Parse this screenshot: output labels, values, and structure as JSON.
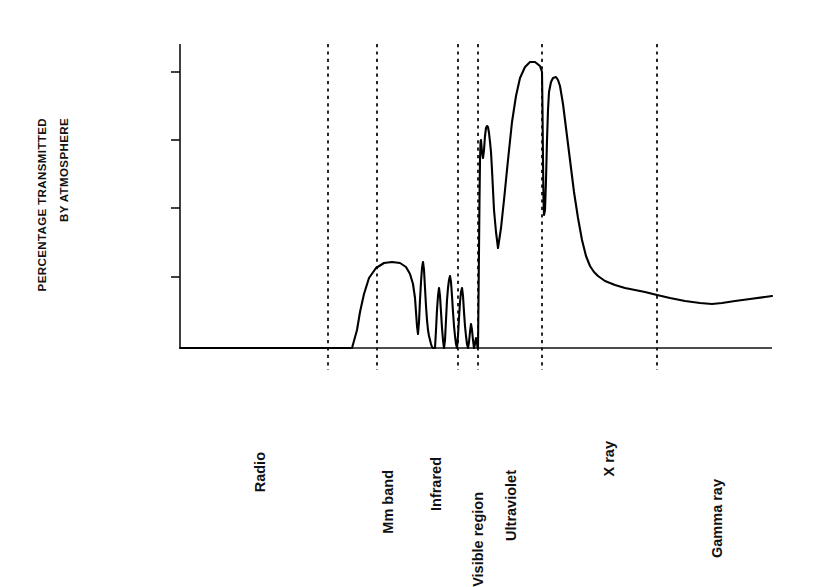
{
  "chart_data": {
    "type": "line",
    "title": "",
    "subtitle": "",
    "xlabel": "",
    "ylabel": "PERCENTAGE TRANSMITTED BY ATMOSPHERE",
    "ylabel_lines": [
      "PERCENTAGE TRANSMITTED",
      "BY ATMOSPHERE"
    ],
    "grid": false,
    "legend": "none",
    "y_scale": "log-inverted",
    "y_tick_labels": [
      "1%",
      ".01%",
      ".0001%",
      ".000001%"
    ],
    "y_ticks": [
      {
        "label": ".000001%",
        "y_px": 72
      },
      {
        "label": ".0001%",
        "y_px": 140
      },
      {
        "label": ".01%",
        "y_px": 208
      },
      {
        "label": "1%",
        "y_px": 277
      }
    ],
    "axis": {
      "x_left_px": 180,
      "x_right_px": 772,
      "y_top_px": 44,
      "y_baseline_px": 348
    },
    "band_labels": [
      "Radio",
      "Mm band",
      "Infrared",
      "Visible region",
      "Ultraviolet",
      "X ray",
      "Gamma ray"
    ],
    "bands": [
      {
        "name": "Radio",
        "label_x_px": 252,
        "label_y_px": 452
      },
      {
        "name": "Mm band",
        "label_x_px": 380,
        "label_y_px": 470
      },
      {
        "name": "Infrared",
        "label_x_px": 428,
        "label_y_px": 457
      },
      {
        "name": "Visible region",
        "label_x_px": 470,
        "label_y_px": 492
      },
      {
        "name": "Ultraviolet",
        "label_x_px": 503,
        "label_y_px": 470
      },
      {
        "name": "X ray",
        "label_x_px": 601,
        "label_y_px": 441
      },
      {
        "name": "Gamma ray",
        "label_x_px": 709,
        "label_y_px": 479
      }
    ],
    "divider_x_px": [
      328,
      377,
      458,
      478,
      542,
      657
    ],
    "divider_style": "dashed",
    "series": [
      {
        "name": "Atmospheric transmission",
        "color": "#000000",
        "points_px": [
          [
            180,
            348
          ],
          [
            315,
            348
          ],
          [
            352,
            348
          ],
          [
            357,
            330
          ],
          [
            360,
            312
          ],
          [
            364,
            294
          ],
          [
            369,
            278
          ],
          [
            376,
            268
          ],
          [
            384,
            263
          ],
          [
            392,
            262
          ],
          [
            400,
            263
          ],
          [
            406,
            267
          ],
          [
            410,
            274
          ],
          [
            413,
            284
          ],
          [
            415,
            298
          ],
          [
            416,
            312
          ],
          [
            417,
            326
          ],
          [
            418,
            334
          ],
          [
            419,
            322
          ],
          [
            420,
            300
          ],
          [
            421,
            282
          ],
          [
            422,
            268
          ],
          [
            423,
            262
          ],
          [
            424,
            270
          ],
          [
            425,
            288
          ],
          [
            426,
            306
          ],
          [
            427,
            320
          ],
          [
            428,
            330
          ],
          [
            429,
            336
          ],
          [
            430,
            340
          ],
          [
            431,
            344
          ],
          [
            432,
            347
          ],
          [
            433,
            348
          ],
          [
            435,
            348
          ],
          [
            436,
            330
          ],
          [
            437,
            310
          ],
          [
            438,
            296
          ],
          [
            439,
            288
          ],
          [
            440,
            296
          ],
          [
            441,
            312
          ],
          [
            442,
            328
          ],
          [
            443,
            340
          ],
          [
            444,
            348
          ],
          [
            445,
            340
          ],
          [
            446,
            320
          ],
          [
            447,
            300
          ],
          [
            448,
            288
          ],
          [
            449,
            280
          ],
          [
            450,
            276
          ],
          [
            451,
            282
          ],
          [
            452,
            296
          ],
          [
            453,
            312
          ],
          [
            454,
            326
          ],
          [
            455,
            336
          ],
          [
            456,
            344
          ],
          [
            457,
            348
          ],
          [
            458,
            336
          ],
          [
            459,
            318
          ],
          [
            460,
            302
          ],
          [
            461,
            292
          ],
          [
            462,
            288
          ],
          [
            463,
            296
          ],
          [
            464,
            312
          ],
          [
            465,
            326
          ],
          [
            466,
            336
          ],
          [
            467,
            344
          ],
          [
            468,
            348
          ],
          [
            469,
            342
          ],
          [
            470,
            332
          ],
          [
            471,
            324
          ],
          [
            472,
            330
          ],
          [
            473,
            340
          ],
          [
            474,
            348
          ],
          [
            475,
            344
          ],
          [
            476,
            338
          ],
          [
            477,
            342
          ],
          [
            477.5,
            348
          ],
          [
            478,
            348
          ],
          [
            478.5,
            300
          ],
          [
            479,
            250
          ],
          [
            479.5,
            200
          ],
          [
            480,
            160
          ],
          [
            480.5,
            142
          ],
          [
            481,
            140
          ],
          [
            482,
            152
          ],
          [
            483,
            158
          ],
          [
            484,
            150
          ],
          [
            485,
            136
          ],
          [
            486,
            128
          ],
          [
            487,
            126
          ],
          [
            488,
            127
          ],
          [
            489,
            133
          ],
          [
            490,
            142
          ],
          [
            491,
            152
          ],
          [
            492,
            170
          ],
          [
            493,
            190
          ],
          [
            494,
            210
          ],
          [
            496,
            232
          ],
          [
            498,
            248
          ],
          [
            501,
            228
          ],
          [
            504,
            200
          ],
          [
            508,
            160
          ],
          [
            512,
            122
          ],
          [
            516,
            96
          ],
          [
            520,
            78
          ],
          [
            525,
            67
          ],
          [
            530,
            62
          ],
          [
            535,
            62
          ],
          [
            540,
            66
          ],
          [
            542,
            72
          ],
          [
            542.5,
            110
          ],
          [
            543,
            160
          ],
          [
            543.5,
            200
          ],
          [
            544,
            215
          ],
          [
            545,
            210
          ],
          [
            546,
            180
          ],
          [
            547,
            140
          ],
          [
            548,
            110
          ],
          [
            549,
            92
          ],
          [
            551,
            82
          ],
          [
            553,
            78
          ],
          [
            556,
            77
          ],
          [
            558,
            80
          ],
          [
            560,
            86
          ],
          [
            563,
            104
          ],
          [
            566,
            128
          ],
          [
            570,
            160
          ],
          [
            574,
            192
          ],
          [
            578,
            218
          ],
          [
            582,
            240
          ],
          [
            586,
            256
          ],
          [
            590,
            266
          ],
          [
            594,
            272
          ],
          [
            598,
            276
          ],
          [
            605,
            281
          ],
          [
            615,
            285
          ],
          [
            625,
            288
          ],
          [
            635,
            290
          ],
          [
            645,
            292
          ],
          [
            657,
            295
          ],
          [
            670,
            298
          ],
          [
            685,
            301
          ],
          [
            700,
            303
          ],
          [
            712,
            304
          ],
          [
            722,
            303
          ],
          [
            735,
            301
          ],
          [
            750,
            299
          ],
          [
            765,
            297
          ],
          [
            772,
            296
          ]
        ]
      }
    ]
  },
  "colors": {
    "background": "#ffffff",
    "ink": "#111111",
    "curve": "#000000",
    "divider": "#000000"
  }
}
